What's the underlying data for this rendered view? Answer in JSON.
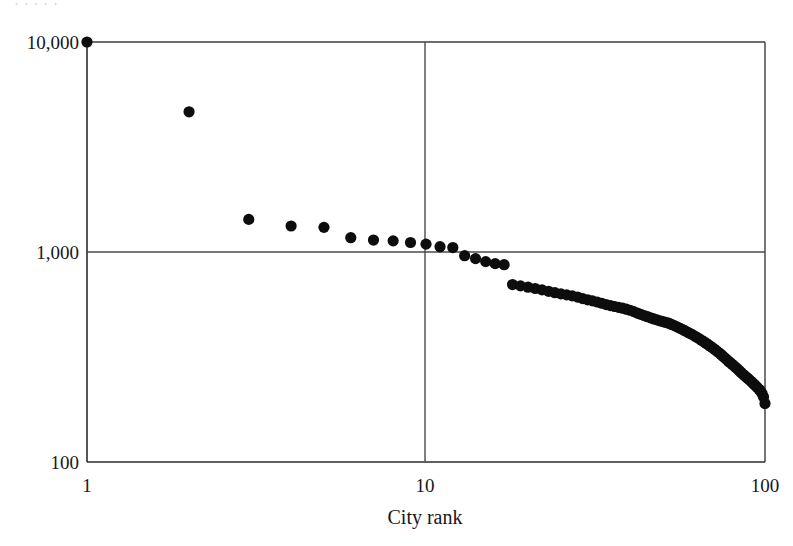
{
  "chart_data": {
    "type": "scatter",
    "title": "",
    "xlabel": "City rank",
    "ylabel": "",
    "x_scale": "log",
    "y_scale": "log",
    "xlim": [
      1,
      100
    ],
    "ylim": [
      100,
      10000
    ],
    "grid": true,
    "legend": null,
    "x_tick_labels": [
      "1",
      "10",
      "100"
    ],
    "x_tick_values": [
      1,
      10,
      100
    ],
    "y_tick_labels": [
      "100",
      "1,000",
      "10,000"
    ],
    "y_tick_values": [
      100,
      1000,
      10000
    ],
    "marker": "filled-circle",
    "marker_color": "#0d0d0d",
    "series_name": "City population by rank",
    "x": [
      1,
      2,
      3,
      4,
      5,
      6,
      7,
      8,
      9,
      10,
      11,
      12,
      13,
      14,
      15,
      16,
      17,
      18,
      19,
      20,
      21,
      22,
      23,
      24,
      25,
      26,
      27,
      28,
      29,
      30,
      31,
      32,
      33,
      34,
      35,
      36,
      37,
      38,
      39,
      40,
      41,
      42,
      43,
      44,
      45,
      46,
      47,
      48,
      49,
      50,
      51,
      52,
      53,
      54,
      55,
      56,
      57,
      58,
      59,
      60,
      61,
      62,
      63,
      64,
      65,
      66,
      67,
      68,
      69,
      70,
      71,
      72,
      73,
      74,
      75,
      76,
      77,
      78,
      79,
      80,
      81,
      82,
      83,
      84,
      85,
      86,
      87,
      88,
      89,
      90,
      91,
      92,
      93,
      94,
      95,
      96,
      97,
      98,
      99,
      100
    ],
    "y": [
      10000,
      4650,
      1430,
      1330,
      1310,
      1170,
      1140,
      1130,
      1110,
      1090,
      1060,
      1050,
      960,
      930,
      900,
      880,
      870,
      700,
      690,
      680,
      670,
      660,
      650,
      640,
      632,
      625,
      618,
      610,
      600,
      592,
      585,
      578,
      570,
      562,
      556,
      550,
      545,
      540,
      534,
      528,
      520,
      512,
      505,
      498,
      492,
      486,
      480,
      475,
      470,
      466,
      462,
      458,
      452,
      446,
      440,
      434,
      428,
      422,
      416,
      410,
      404,
      398,
      392,
      386,
      380,
      374,
      368,
      362,
      356,
      350,
      344,
      338,
      332,
      326,
      320,
      314,
      308,
      302,
      297,
      292,
      287,
      282,
      277,
      272,
      267,
      262,
      258,
      254,
      250,
      246,
      242,
      238,
      234,
      230,
      226,
      222,
      218,
      212,
      204,
      190
    ]
  },
  "axis": {
    "x_label": "City rank",
    "x_ticks": [
      "1",
      "10",
      "100"
    ],
    "y_ticks": [
      "100",
      "1,000",
      "10,000"
    ]
  },
  "top_artifact": {
    "text": "·  ·   ·     ·    ·"
  }
}
